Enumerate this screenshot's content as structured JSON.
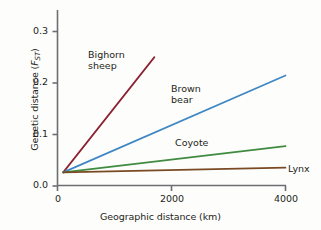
{
  "chart_data": {
    "type": "line",
    "title": "",
    "xlabel": "Geographic distance (km)",
    "ylabel_prefix": "Genetic distance (",
    "ylabel_symbol": "F",
    "ylabel_subscript": "ST",
    "ylabel_suffix": ")",
    "ylabel_plain": "Genetic distance (FST)",
    "xlim": [
      0,
      4000
    ],
    "ylim": [
      0.0,
      0.335
    ],
    "xticks": [
      0,
      2000,
      4000
    ],
    "xtick_labels": [
      "0",
      "2000",
      "4000"
    ],
    "yticks": [
      0.0,
      0.1,
      0.2,
      0.3
    ],
    "ytick_labels": [
      "0.0",
      "0.1",
      "0.2",
      "0.3"
    ],
    "grid": false,
    "legend_position": "inline-annotations",
    "series": [
      {
        "name": "Bighorn sheep",
        "label": "Bighorn sheep",
        "label_line1": "Bighorn",
        "label_line2": "sheep",
        "color": "#8c2132",
        "x": [
          100,
          1700
        ],
        "y": [
          0.025,
          0.245
        ]
      },
      {
        "name": "Brown bear",
        "label": "Brown bear",
        "label_line1": "Brown",
        "label_line2": "bear",
        "color": "#3f87c4",
        "x": [
          100,
          4000
        ],
        "y": [
          0.025,
          0.21
        ]
      },
      {
        "name": "Coyote",
        "label": "Coyote",
        "label_line1": "Coyote",
        "label_line2": "",
        "color": "#3f8b3f",
        "x": [
          100,
          4000
        ],
        "y": [
          0.025,
          0.075
        ]
      },
      {
        "name": "Lynx",
        "label": "Lynx",
        "label_line1": "Lynx",
        "label_line2": "",
        "color": "#7a4a24",
        "x": [
          100,
          4000
        ],
        "y": [
          0.025,
          0.034
        ]
      }
    ],
    "axis_color": "#6d6e71",
    "background_color": "#fdfdfc"
  },
  "axes": {
    "x_title": "Geographic distance (km)",
    "y_title_prefix": "Genetic distance (",
    "y_title_symbol": "F",
    "y_title_subscript": "ST",
    "y_title_suffix": ")",
    "ytick_0": "0.0",
    "ytick_1": "0.1",
    "ytick_2": "0.2",
    "ytick_3": "0.3",
    "xtick_0": "0",
    "xtick_1": "2000",
    "xtick_2": "4000"
  },
  "annotations": {
    "bighorn_line1": "Bighorn",
    "bighorn_line2": "sheep",
    "brownbear_line1": "Brown",
    "brownbear_line2": "bear",
    "coyote": "Coyote",
    "lynx": "Lynx"
  }
}
